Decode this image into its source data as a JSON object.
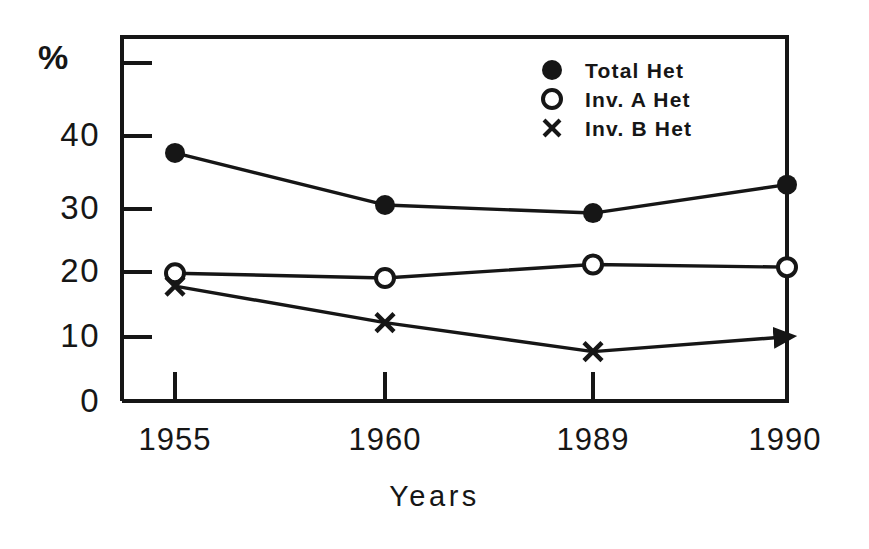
{
  "chart_data": {
    "type": "line",
    "title": "",
    "subtitle": "",
    "xlabel": "Years",
    "ylabel": "%",
    "categories": [
      "1955",
      "1960",
      "1989",
      "1990"
    ],
    "x_tick_labels": [
      "1955",
      "1960",
      "1989",
      "1990"
    ],
    "y_tick_labels": [
      "0",
      "10",
      "20",
      "30",
      "40",
      ""
    ],
    "y_tick_values": [
      0,
      10,
      20,
      30,
      40,
      50
    ],
    "ylim": [
      0,
      50
    ],
    "grid": false,
    "legend_position": "top-right",
    "series": [
      {
        "name": "Total Het",
        "marker": "filled-circle",
        "values": [
          36.7,
          29.0,
          27.8,
          32.0
        ]
      },
      {
        "name": "Inv. A Het",
        "marker": "open-circle",
        "values": [
          18.9,
          18.2,
          20.2,
          19.8
        ]
      },
      {
        "name": "Inv. B Het",
        "marker": "cross",
        "values": [
          17.0,
          11.6,
          7.3,
          9.5
        ]
      }
    ],
    "annotations": [
      {
        "text": "arrowhead at final Inv. B Het point",
        "at_category": "1990",
        "series": "Inv. B Het"
      }
    ]
  },
  "axes": {
    "y_title": "%",
    "x_title": "Years",
    "y_labels": {
      "l0": "0",
      "l10": "10",
      "l20": "20",
      "l30": "30",
      "l40": "40"
    },
    "x_labels": {
      "t0": "1955",
      "t1": "1960",
      "t2": "1989",
      "t3": "1990"
    }
  },
  "legend": {
    "items": [
      {
        "label": "Total Het",
        "marker": "filled-circle"
      },
      {
        "label": "Inv. A Het",
        "marker": "open-circle"
      },
      {
        "label": "Inv. B Het",
        "marker": "cross"
      }
    ]
  },
  "colors": {
    "ink": "#161616",
    "background": "#ffffff"
  }
}
